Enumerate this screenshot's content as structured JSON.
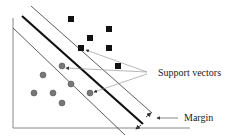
{
  "diagram": {
    "type": "svm-margin-illustration",
    "labels": {
      "support_vectors": "Support vectors",
      "margin": "Margin"
    },
    "classes": [
      {
        "name": "class-square",
        "marker": "square",
        "color": "#111111",
        "count": 6
      },
      {
        "name": "class-circle",
        "marker": "circle",
        "color": "#777777",
        "count": 7
      }
    ],
    "support_vector_count": 3,
    "colors": {
      "hyperplane": "#111111",
      "margin_lines": "#333333",
      "axes": "#888888",
      "arrows": "#888888"
    }
  }
}
